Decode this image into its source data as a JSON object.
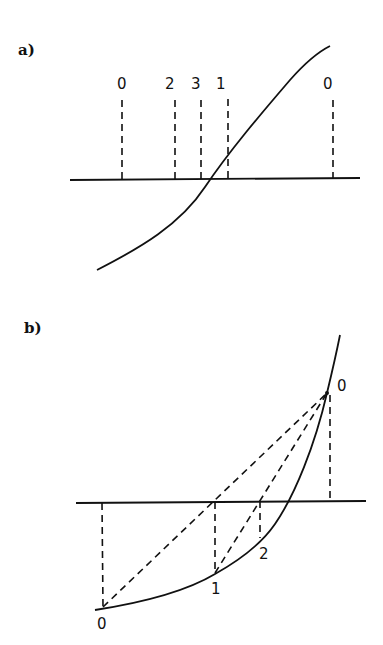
{
  "figure": {
    "panel_a": {
      "label": "a)",
      "description": "S-shaped curve crossing horizontal axis; dashed verticals mark iterates",
      "iterate_labels": [
        "0",
        "2",
        "3",
        "1",
        "0"
      ],
      "iterate_x": [
        122,
        175,
        201,
        228,
        333
      ]
    },
    "panel_b": {
      "label": "b)",
      "description": "Convex curve crossing axis; dashed secant chords from endpoint 0 to successive iterates",
      "point_labels": {
        "top": "0",
        "bottom": "0",
        "first": "1",
        "second": "2"
      }
    }
  }
}
